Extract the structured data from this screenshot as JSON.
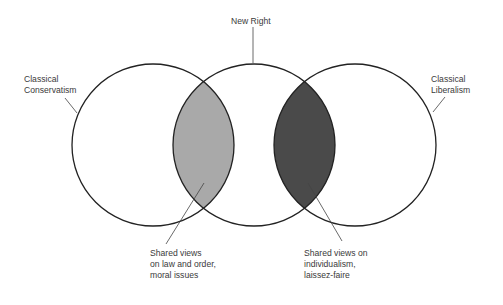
{
  "diagram": {
    "type": "venn",
    "circles": [
      {
        "id": "left",
        "label_lines": [
          "Classical",
          "Conservatism"
        ]
      },
      {
        "id": "middle",
        "label_lines": [
          "New Right"
        ]
      },
      {
        "id": "right",
        "label_lines": [
          "Classical",
          "Liberalism"
        ]
      }
    ],
    "overlaps": [
      {
        "between": [
          "left",
          "middle"
        ],
        "fill": "#a9a9a9",
        "label_lines": [
          "Shared views",
          "on law and order,",
          "moral issues"
        ]
      },
      {
        "between": [
          "middle",
          "right"
        ],
        "fill": "#4a4a4a",
        "label_lines": [
          "Shared views on",
          "individualism,",
          "laissez-faire"
        ]
      }
    ]
  },
  "colors": {
    "stroke": "#222222",
    "light_overlap": "#a9a9a9",
    "dark_overlap": "#4a4a4a",
    "background": "#ffffff"
  }
}
